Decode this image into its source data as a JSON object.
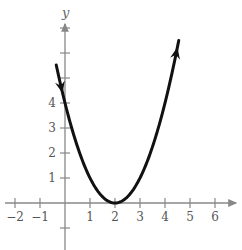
{
  "chart_data": {
    "type": "line",
    "title": "",
    "xlabel": "",
    "ylabel": "y",
    "function": "y = (x - 2)^2",
    "xlim": [
      -2.5,
      7
    ],
    "ylim": [
      -1.8,
      8.2
    ],
    "x_ticks": [
      -2,
      -1,
      1,
      2,
      3,
      4,
      5,
      6
    ],
    "y_ticks": [
      1,
      2,
      3,
      4
    ],
    "y_tick_marks": [
      -1,
      1,
      2,
      3,
      4,
      5,
      6,
      7
    ],
    "grid": false,
    "legend": null,
    "series": [
      {
        "name": "parabola",
        "x": [
          -0.3,
          0,
          0.5,
          1,
          1.5,
          2,
          2.5,
          3,
          3.5,
          4,
          4.5
        ],
        "values": [
          5.29,
          4,
          2.25,
          1,
          0.25,
          0,
          0.25,
          1,
          2.25,
          4,
          6.25
        ],
        "color": "#111111",
        "arrows": [
          "left-end-downward",
          "right-end-upward"
        ]
      }
    ],
    "vertex": [
      2,
      0
    ]
  },
  "labels": {
    "y_axis": "y",
    "x_ticks": [
      "−2",
      "−1",
      "1",
      "2",
      "3",
      "4",
      "5",
      "6"
    ],
    "y_ticks": [
      "1",
      "2",
      "3",
      "4"
    ]
  }
}
